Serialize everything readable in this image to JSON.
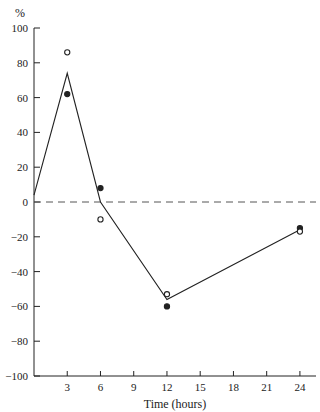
{
  "chart_data": {
    "type": "line",
    "title": "",
    "xlabel": "Time (hours)",
    "ylabel": "%",
    "xlim": [
      0,
      26
    ],
    "ylim": [
      -100,
      100
    ],
    "x_ticks": [
      3,
      6,
      9,
      12,
      15,
      18,
      21,
      24
    ],
    "y_ticks": [
      100,
      80,
      60,
      40,
      20,
      0,
      -20,
      -40,
      -60,
      -80,
      -100
    ],
    "y_tick_labels": [
      "100",
      "80",
      "60",
      "40",
      "20",
      "0",
      "−20",
      "−40",
      "−60",
      "−80",
      "−100"
    ],
    "grid": false,
    "legend": null,
    "reference_line": {
      "y": 0,
      "style": "dashed"
    },
    "series": [
      {
        "name": "mean line",
        "kind": "line",
        "x": [
          0,
          3,
          6,
          12,
          24
        ],
        "values": [
          4,
          74,
          0,
          -56,
          -16
        ]
      },
      {
        "name": "filled circles",
        "kind": "scatter",
        "marker": "filled-circle",
        "x": [
          3,
          6,
          12,
          24
        ],
        "values": [
          62,
          8,
          -60,
          -15
        ]
      },
      {
        "name": "open circles",
        "kind": "scatter",
        "marker": "open-circle",
        "x": [
          3,
          6,
          12,
          24
        ],
        "values": [
          86,
          -10,
          -53,
          -17
        ]
      }
    ]
  },
  "colors": {
    "ink": "#222222",
    "background": "#ffffff"
  }
}
